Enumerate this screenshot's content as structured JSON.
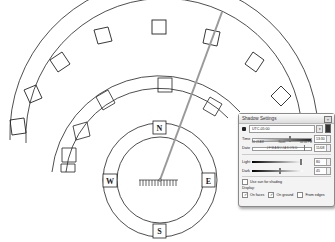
{
  "scene": {
    "compass": {
      "north_label": "N",
      "south_label": "S",
      "east_label": "E",
      "west_label": "W"
    },
    "colors": {
      "line": "#222222",
      "sun_ray": "#9a9a9a",
      "background": "#ffffff"
    }
  },
  "dialog": {
    "title": "Shadow Settings",
    "close_glyph": "×",
    "timezone": "UTC-05:00",
    "time": {
      "label": "Time",
      "start": "06:43 AM",
      "middle": "Noon",
      "end": "04:46 PM",
      "value": "13:30"
    },
    "date": {
      "label": "Date",
      "months": "J F M A M J J A S O N D",
      "value": "11/08"
    },
    "light": {
      "label": "Light",
      "value": "80"
    },
    "dark": {
      "label": "Dark",
      "value": "45"
    },
    "use_sun_label": "Use sun for shading",
    "display_label": "Display:",
    "options": [
      {
        "label": "On faces",
        "checked": true
      },
      {
        "label": "On ground",
        "checked": true
      },
      {
        "label": "From edges",
        "checked": false
      }
    ]
  }
}
